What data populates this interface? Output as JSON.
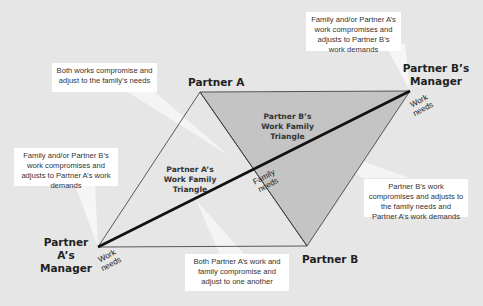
{
  "colors": {
    "background": "#e6e6e6",
    "shaded_triangle": "#c4c4c4",
    "callout": "#ffffff",
    "line": "#111111"
  },
  "vertices": {
    "partner_a": "Partner A",
    "partner_b": "Partner B",
    "partner_a_manager": {
      "line1": "Partner A’s",
      "line2": "Manager"
    },
    "partner_b_manager": {
      "line1": "Partner B’s",
      "line2": "Manager"
    }
  },
  "triangles": {
    "a": {
      "line1": "Partner A’s",
      "line2": "Work Family",
      "line3": "Triangle"
    },
    "b": {
      "line1": "Partner B’s",
      "line2": "Work Family",
      "line3": "Triangle"
    }
  },
  "edge_labels": {
    "work_needs_a": {
      "line1": "Work",
      "line2": "needs"
    },
    "work_needs_b": {
      "line1": "Work",
      "line2": "needs"
    },
    "family_needs": {
      "line1": "Family",
      "line2": "needs"
    }
  },
  "callouts": {
    "top_left": "Both works compromise and adjust to the family’s needs",
    "top_right": "Family and/or Partner A’s work compromises and adjusts to Partner B’s work demands",
    "left": "Family and/or Partner B’s work compromises and adjusts to Partner A’s work demands",
    "bottom": "Both Partner A’s work and family compromise and adjust to one another",
    "right": "Partner B’s work compromises and adjusts to the family needs and Partner A’s work demands"
  }
}
